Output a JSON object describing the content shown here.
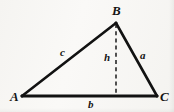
{
  "figure": {
    "kind": "geometry-diagram",
    "shape": "triangle",
    "background_color": "#f7f6f3",
    "stroke_color": "#121212",
    "canvas": {
      "width": 174,
      "height": 112
    },
    "vertices": [
      {
        "name": "A",
        "label": "A",
        "x": 22,
        "y": 96
      },
      {
        "name": "B",
        "label": "B",
        "x": 116,
        "y": 23
      },
      {
        "name": "C",
        "label": "C",
        "x": 157,
        "y": 96
      }
    ],
    "sides": [
      {
        "name": "a",
        "label": "a",
        "from": "B",
        "to": "C",
        "style": "solid"
      },
      {
        "name": "b",
        "label": "b",
        "from": "A",
        "to": "C",
        "style": "solid"
      },
      {
        "name": "c",
        "label": "c",
        "from": "A",
        "to": "B",
        "style": "solid"
      }
    ],
    "altitude": {
      "name": "h",
      "label": "h",
      "from": "B",
      "foot_x": 116,
      "foot_y": 96,
      "top_x": 116,
      "top_y": 23,
      "style": "dashed"
    },
    "labels": {
      "vertex_a": "A",
      "vertex_b": "B",
      "vertex_c": "C",
      "side_a": "a",
      "side_b": "b",
      "side_c": "c",
      "height": "h"
    }
  }
}
